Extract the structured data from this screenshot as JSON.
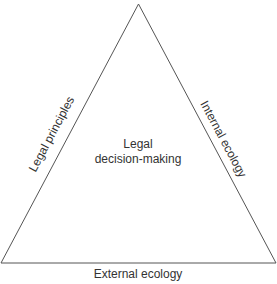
{
  "diagram": {
    "type": "triangle",
    "stroke_color": "#555555",
    "text_color": "#333333",
    "center_label": {
      "line1": "Legal",
      "line2": "decision-making"
    },
    "sides": {
      "left": "Legal principles",
      "right": "Internal ecology",
      "bottom": "External ecology"
    }
  }
}
